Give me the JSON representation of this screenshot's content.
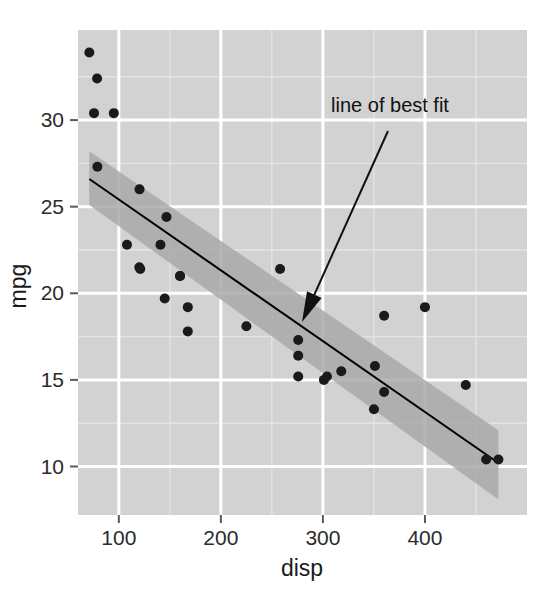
{
  "chart_data": {
    "type": "scatter",
    "title": "",
    "xlabel": "disp",
    "ylabel": "mpg",
    "xlim": [
      60,
      500
    ],
    "ylim": [
      7.2,
      35.2
    ],
    "xticks": [
      100,
      200,
      300,
      400
    ],
    "xticklabels": [
      "100",
      "200",
      "300",
      "400"
    ],
    "yticks": [
      10,
      15,
      20,
      25,
      30
    ],
    "yticklabels": [
      "10",
      "15",
      "20",
      "25",
      "30"
    ],
    "x_minor_ticks": [
      150,
      250,
      350,
      450
    ],
    "y_minor_ticks": [
      12.5,
      17.5,
      22.5,
      27.5,
      32.5
    ],
    "grid": true,
    "grid_color": "#ffffff",
    "panel_background": "#d2d2d2",
    "point_color": "#1a1a1a",
    "point_size": 5,
    "legend": "none",
    "x": [
      160,
      160,
      108,
      258,
      360,
      225,
      360,
      146.7,
      140.8,
      167.6,
      167.6,
      275.8,
      275.8,
      275.8,
      472,
      460,
      440,
      78.7,
      75.7,
      71.1,
      120.1,
      318,
      304,
      350,
      400,
      79,
      120.3,
      95.1,
      351,
      145,
      301,
      121
    ],
    "y": [
      21,
      21,
      22.8,
      21.4,
      18.7,
      18.1,
      14.3,
      24.4,
      22.8,
      19.2,
      17.8,
      16.4,
      17.3,
      15.2,
      10.4,
      10.4,
      14.7,
      32.4,
      30.4,
      33.9,
      21.5,
      15.5,
      15.2,
      13.3,
      19.2,
      27.3,
      26,
      30.4,
      15.8,
      19.7,
      15,
      21.4
    ],
    "series": [
      {
        "name": "line of best fit",
        "type": "line",
        "color": "#000000",
        "line_width": 2,
        "x_start": 71.1,
        "y_start": 26.6,
        "x_end": 472,
        "y_end": 10.2
      },
      {
        "name": "confidence ribbon",
        "type": "band",
        "color": "#a9a9a9",
        "opacity": 0.85,
        "x_start": 71.1,
        "y_upper_start": 28.2,
        "y_lower_start": 25.1,
        "x_end": 472,
        "y_upper_end": 12.1,
        "y_lower_end": 8.1
      }
    ],
    "annotations": [
      {
        "name": "line-of-best-fit-annotation",
        "text": "line of best fit",
        "text_x": 390,
        "text_y": 112,
        "arrow_tail_x": 388,
        "arrow_tail_y": 131,
        "arrow_head_x": 302,
        "arrow_head_y": 322,
        "arrow_color": "#111111"
      }
    ]
  },
  "axes": {
    "x_title": "disp",
    "y_title": "mpg",
    "x_tick_labels": [
      "100",
      "200",
      "300",
      "400"
    ],
    "y_tick_labels": [
      "10",
      "15",
      "20",
      "25",
      "30"
    ]
  },
  "annotation": {
    "label": "line of best fit"
  },
  "colors": {
    "panel": "#d2d2d2",
    "grid_major": "#ffffff",
    "grid_minor": "#e4e4e4",
    "ribbon": "#a9a9a9",
    "fit_line": "#000000",
    "point": "#1a1a1a",
    "text": "#1a1a1a",
    "page_background": "#ffffff"
  }
}
